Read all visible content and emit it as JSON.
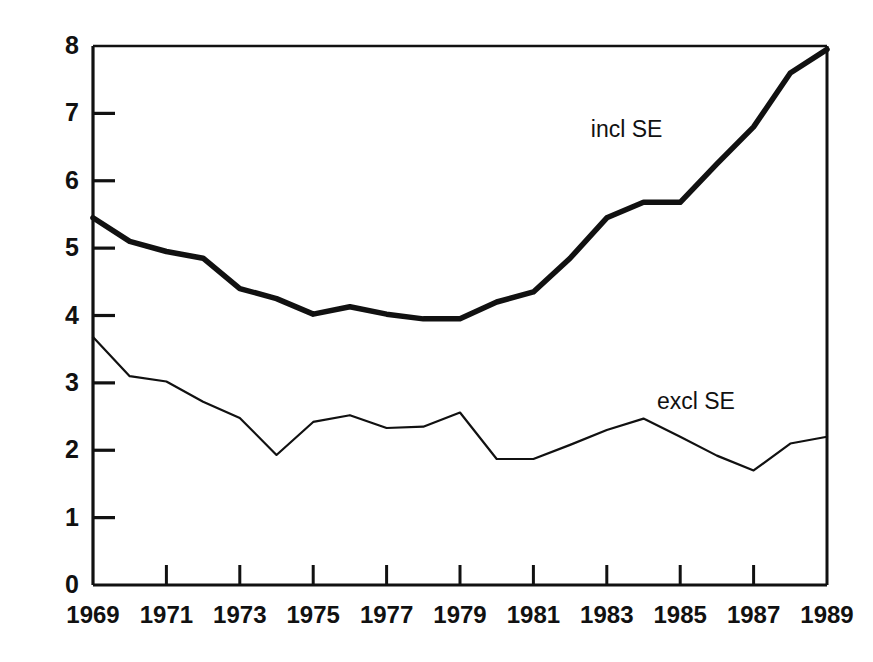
{
  "chart_data": {
    "type": "line",
    "title": "",
    "subtitle": "",
    "xlabel": "",
    "ylabel": "",
    "xlim": [
      1969,
      1989
    ],
    "ylim": [
      0,
      8
    ],
    "grid": false,
    "legend_position": "inline-annotation",
    "x": [
      1969,
      1970,
      1971,
      1972,
      1973,
      1974,
      1975,
      1976,
      1977,
      1978,
      1979,
      1980,
      1981,
      1982,
      1983,
      1984,
      1985,
      1986,
      1987,
      1988,
      1989
    ],
    "x_tick_labels": [
      "1969",
      "1971",
      "1973",
      "1975",
      "1977",
      "1979",
      "1981",
      "1983",
      "1985",
      "1987",
      "1989"
    ],
    "x_ticks": [
      1969,
      1971,
      1973,
      1975,
      1977,
      1979,
      1981,
      1983,
      1985,
      1987,
      1989
    ],
    "y_tick_labels": [
      "0",
      "1",
      "2",
      "3",
      "4",
      "5",
      "6",
      "7",
      "8"
    ],
    "y_ticks": [
      0,
      1,
      2,
      3,
      4,
      5,
      6,
      7,
      8
    ],
    "series": [
      {
        "name": "incl SE",
        "label": "incl SE",
        "color": "#111111",
        "line_width": 5.5,
        "label_x": 1984.2,
        "label_y": 6.75,
        "values": [
          5.45,
          5.1,
          4.95,
          4.85,
          4.4,
          4.25,
          4.02,
          4.13,
          4.02,
          3.95,
          3.95,
          4.2,
          4.35,
          4.85,
          5.45,
          5.68,
          5.68,
          6.25,
          6.8,
          7.6,
          7.95
        ]
      },
      {
        "name": "excl SE",
        "label": "excl SE",
        "color": "#111111",
        "line_width": 2.2,
        "label_x": 1986.0,
        "label_y": 2.72,
        "values": [
          3.68,
          3.1,
          3.02,
          2.72,
          2.48,
          1.93,
          2.42,
          2.52,
          2.33,
          2.35,
          2.56,
          1.87,
          1.87,
          2.08,
          2.3,
          2.47,
          2.2,
          1.92,
          1.7,
          2.1,
          2.2
        ]
      }
    ]
  },
  "axes": {
    "y_axis_name": "y-axis",
    "x_axis_name": "x-axis"
  }
}
